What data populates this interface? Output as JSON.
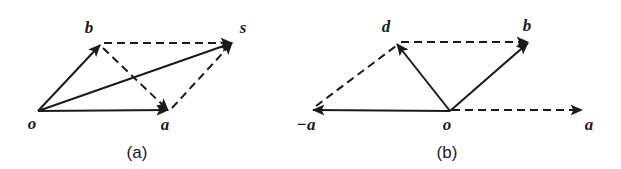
{
  "figure": {
    "background_color": "#ffffff",
    "stroke_color": "#1a1a1a",
    "solid_width": 2.0,
    "dashed_width": 2.0,
    "dash_pattern": "8,5"
  },
  "panels": [
    {
      "id": "panel-a",
      "caption": "(a)",
      "caption_x": 137,
      "caption_y": 158,
      "description": "Parallelogram rule for vector addition: s = a + b",
      "points": {
        "o": {
          "x": 38,
          "y": 111,
          "label": "o",
          "label_x": 32,
          "label_y": 129
        },
        "a": {
          "x": 168,
          "y": 110,
          "label": "a",
          "label_x": 165,
          "label_y": 130
        },
        "b": {
          "x": 100,
          "y": 45,
          "label": "b",
          "label_x": 89,
          "label_y": 33
        },
        "s": {
          "x": 232,
          "y": 43,
          "label": "s",
          "label_x": 243,
          "label_y": 33
        }
      },
      "edges": [
        {
          "name": "o-to-a",
          "from": "o",
          "to": "a",
          "style": "solid",
          "arrow": true
        },
        {
          "name": "o-to-b",
          "from": "o",
          "to": "b",
          "style": "solid",
          "arrow": true
        },
        {
          "name": "o-to-s",
          "from": "o",
          "to": "s",
          "style": "solid",
          "arrow": true
        },
        {
          "name": "b-to-s",
          "from": "b",
          "to": "s",
          "style": "dashed",
          "arrow": true
        },
        {
          "name": "a-to-s",
          "from": "a",
          "to": "s",
          "style": "dashed",
          "arrow": true
        },
        {
          "name": "b-to-a",
          "from": "b",
          "to": "a",
          "style": "dashed",
          "arrow": true
        }
      ]
    },
    {
      "id": "panel-b",
      "caption": "(b)",
      "caption_x": 447,
      "caption_y": 158,
      "description": "Vector subtraction: d = b - a, with -a drawn opposite to a",
      "points": {
        "o": {
          "x": 450,
          "y": 111,
          "label": "o",
          "label_x": 444,
          "label_y": 130
        },
        "minus_a": {
          "x": 313,
          "y": 110,
          "label": "−a",
          "label_x": 300,
          "label_y": 130
        },
        "a": {
          "x": 582,
          "y": 110,
          "label": "a",
          "label_x": 585,
          "label_y": 130
        },
        "d": {
          "x": 397,
          "y": 44,
          "label": "d",
          "label_x": 386,
          "label_y": 32
        },
        "b": {
          "x": 528,
          "y": 43,
          "label": "b",
          "label_x": 525,
          "label_y": 31
        }
      },
      "edges": [
        {
          "name": "o-to-minus-a",
          "from": "o",
          "to": "minus_a",
          "style": "solid",
          "arrow": true
        },
        {
          "name": "o-to-a",
          "from": "o",
          "to": "a",
          "style": "dashed",
          "arrow": true
        },
        {
          "name": "o-to-d",
          "from": "o",
          "to": "d",
          "style": "solid",
          "arrow": true
        },
        {
          "name": "o-to-b",
          "from": "o",
          "to": "b",
          "style": "solid",
          "arrow": true
        },
        {
          "name": "d-to-b",
          "from": "d",
          "to": "b",
          "style": "dashed",
          "arrow": true
        },
        {
          "name": "minus-a-to-d",
          "from": "minus_a",
          "to": "d",
          "style": "dashed",
          "arrow": false
        }
      ]
    }
  ]
}
